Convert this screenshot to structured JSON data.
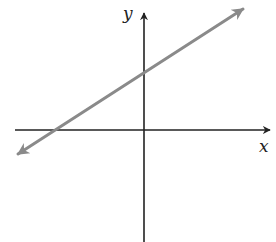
{
  "chart_data": {
    "type": "line",
    "title": "",
    "xlabel": "x",
    "ylabel": "y",
    "grid": false,
    "legend": null,
    "axes_ticks": "none",
    "series": [
      {
        "name": "line",
        "description": "straight line with positive slope, arrows at both ends; positive y-intercept, negative x-intercept",
        "x_intercept_sign": "negative",
        "y_intercept_sign": "positive",
        "slope_sign": "positive",
        "pixel_points": [
          [
            18,
            154
          ],
          [
            243,
            9
          ]
        ]
      }
    ]
  },
  "layout": {
    "width": 276,
    "height": 242,
    "origin": [
      144,
      130
    ],
    "x_axis": {
      "x1": 15,
      "x2": 270,
      "y": 130
    },
    "y_axis": {
      "x": 144,
      "y1": 242,
      "y2": 13
    },
    "line": {
      "x1": 18,
      "y1": 154,
      "x2": 243,
      "y2": 9
    },
    "labels": {
      "y": {
        "left": 123,
        "top": 5
      },
      "x": {
        "left": 259,
        "top": 138
      }
    }
  },
  "colors": {
    "axis": "#222222",
    "line": "#8a8a8a",
    "background": "#ffffff"
  },
  "labels": {
    "x_axis": "x",
    "y_axis": "y"
  }
}
